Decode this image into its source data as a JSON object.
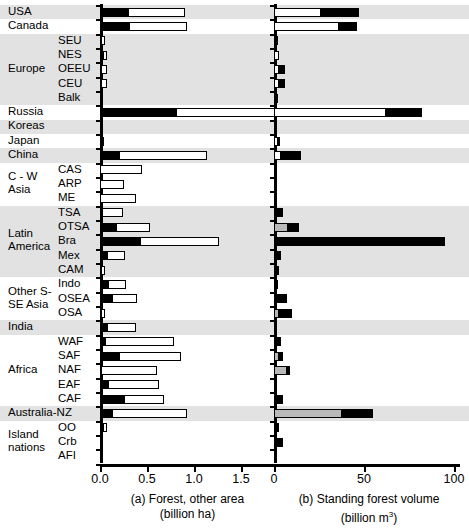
{
  "figure": {
    "panel_a": {
      "caption_line1": "(a) Forest, other area",
      "caption_line2": "(billion ha)"
    },
    "panel_b": {
      "caption_line1": "(b) Standing forest volume",
      "caption_line2": "(billion m",
      "caption_unit_sup": "3",
      "caption_close": ")"
    }
  },
  "chart_data": {
    "type": "bar",
    "orientation": "horizontal",
    "stacked": true,
    "grid": false,
    "legend_position": "none",
    "groups": [
      {
        "name": "USA",
        "band": "gray",
        "rows": [
          "USA"
        ]
      },
      {
        "name": "Canada",
        "band": "white",
        "rows": [
          "Canada"
        ]
      },
      {
        "name": "Europe",
        "band": "gray",
        "rows": [
          "SEU",
          "NES",
          "OEEU",
          "CEU",
          "Balk"
        ]
      },
      {
        "name": "Russia",
        "band": "white",
        "rows": [
          "Russia"
        ]
      },
      {
        "name": "Koreas",
        "band": "gray",
        "rows": [
          "Koreas"
        ]
      },
      {
        "name": "Japan",
        "band": "white",
        "rows": [
          "Japan"
        ]
      },
      {
        "name": "China",
        "band": "gray",
        "rows": [
          "China"
        ]
      },
      {
        "name": "C - W Asia",
        "band": "white",
        "rows": [
          "CAS",
          "ARP",
          "ME"
        ]
      },
      {
        "name": "Latin America",
        "band": "gray",
        "rows": [
          "TSA",
          "OTSA",
          "Bra",
          "Mex",
          "CAM"
        ]
      },
      {
        "name": "Other S- SE Asia",
        "band": "white",
        "rows": [
          "Indo",
          "OSEA",
          "OSA"
        ]
      },
      {
        "name": "India",
        "band": "gray",
        "rows": [
          "India"
        ]
      },
      {
        "name": "Africa",
        "band": "white",
        "rows": [
          "WAF",
          "SAF",
          "NAF",
          "EAF",
          "CAF"
        ]
      },
      {
        "name": "Australia-NZ",
        "band": "gray",
        "rows": [
          "Australia-NZ"
        ]
      },
      {
        "name": "Island nations",
        "band": "white",
        "rows": [
          "OO",
          "Crb",
          "AFI"
        ]
      }
    ],
    "panel_a": {
      "xlabel": "(a) Forest, other area (billion ha)",
      "xlim": [
        0,
        1.75
      ],
      "xticks": [
        0.0,
        0.5,
        1.0,
        1.5
      ],
      "xticklabels": [
        "0.0",
        "0.5",
        "1.0",
        "1.5"
      ],
      "series": [
        {
          "name": "forest",
          "color": "#000000"
        },
        {
          "name": "other",
          "color": "#ffffff"
        }
      ],
      "rows": [
        {
          "label": "USA",
          "forest": 0.3,
          "other": 0.6
        },
        {
          "label": "Canada",
          "forest": 0.31,
          "other": 0.62
        },
        {
          "label": "SEU",
          "forest": 0.01,
          "other": 0.04
        },
        {
          "label": "NES",
          "forest": 0.03,
          "other": 0.04
        },
        {
          "label": "OEEU",
          "forest": 0.01,
          "other": 0.06
        },
        {
          "label": "CEU",
          "forest": 0.01,
          "other": 0.06
        },
        {
          "label": "Balk",
          "forest": 0.01,
          "other": 0.02
        },
        {
          "label": "Russia",
          "forest": 0.81,
          "other": 1.64
        },
        {
          "label": "Koreas",
          "forest": 0.01,
          "other": 0.01
        },
        {
          "label": "Japan",
          "forest": 0.02,
          "other": 0.02
        },
        {
          "label": "China",
          "forest": 0.2,
          "other": 0.94
        },
        {
          "label": "CAS",
          "forest": 0.0,
          "other": 0.45
        },
        {
          "label": "ARP",
          "forest": 0.0,
          "other": 0.25
        },
        {
          "label": "ME",
          "forest": 0.0,
          "other": 0.38
        },
        {
          "label": "TSA",
          "forest": 0.02,
          "other": 0.23
        },
        {
          "label": "OTSA",
          "forest": 0.17,
          "other": 0.36
        },
        {
          "label": "Bra",
          "forest": 0.43,
          "other": 0.84
        },
        {
          "label": "Mex",
          "forest": 0.07,
          "other": 0.2
        },
        {
          "label": "CAM",
          "forest": 0.01,
          "other": 0.04
        },
        {
          "label": "Indo",
          "forest": 0.09,
          "other": 0.19
        },
        {
          "label": "OSEA",
          "forest": 0.13,
          "other": 0.26
        },
        {
          "label": "OSA",
          "forest": 0.01,
          "other": 0.04
        },
        {
          "label": "India",
          "forest": 0.07,
          "other": 0.31
        },
        {
          "label": "WAF",
          "forest": 0.05,
          "other": 0.74
        },
        {
          "label": "SAF",
          "forest": 0.2,
          "other": 0.66
        },
        {
          "label": "NAF",
          "forest": 0.01,
          "other": 0.6
        },
        {
          "label": "EAF",
          "forest": 0.09,
          "other": 0.54
        },
        {
          "label": "CAF",
          "forest": 0.26,
          "other": 0.42
        },
        {
          "label": "Australia-NZ",
          "forest": 0.13,
          "other": 0.8
        },
        {
          "label": "OO",
          "forest": 0.03,
          "other": 0.04
        },
        {
          "label": "Crb",
          "forest": 0.01,
          "other": 0.02
        },
        {
          "label": "AFI",
          "forest": 0.0,
          "other": 0.01
        }
      ]
    },
    "panel_b": {
      "xlabel": "(b) Standing forest volume (billion m3)",
      "xlim": [
        0,
        100
      ],
      "xticks": [
        0,
        50,
        100
      ],
      "xticklabels": [
        "0",
        "50",
        "100"
      ],
      "series": [
        {
          "name": "seg1",
          "color": "#ffffff"
        },
        {
          "name": "seg2",
          "color": "#b9b9b9"
        },
        {
          "name": "seg3",
          "color": "#000000"
        }
      ],
      "rows": [
        {
          "label": "USA",
          "seg1": 26,
          "seg2": 0,
          "seg3": 21
        },
        {
          "label": "Canada",
          "seg1": 36,
          "seg2": 0,
          "seg3": 10
        },
        {
          "label": "SEU",
          "seg1": 1,
          "seg2": 0,
          "seg3": 1
        },
        {
          "label": "NES",
          "seg1": 3,
          "seg2": 0,
          "seg3": 0
        },
        {
          "label": "OEEU",
          "seg1": 3,
          "seg2": 0,
          "seg3": 3
        },
        {
          "label": "CEU",
          "seg1": 3,
          "seg2": 0,
          "seg3": 3
        },
        {
          "label": "Balk",
          "seg1": 0,
          "seg2": 0,
          "seg3": 2
        },
        {
          "label": "Russia",
          "seg1": 62,
          "seg2": 0,
          "seg3": 20
        },
        {
          "label": "Koreas",
          "seg1": 0,
          "seg2": 0,
          "seg3": 1
        },
        {
          "label": "Japan",
          "seg1": 2,
          "seg2": 0,
          "seg3": 1
        },
        {
          "label": "China",
          "seg1": 4,
          "seg2": 0,
          "seg3": 11
        },
        {
          "label": "CAS",
          "seg1": 0,
          "seg2": 0,
          "seg3": 1
        },
        {
          "label": "ARP",
          "seg1": 0,
          "seg2": 0,
          "seg3": 0
        },
        {
          "label": "ME",
          "seg1": 0,
          "seg2": 0,
          "seg3": 1
        },
        {
          "label": "TSA",
          "seg1": 0,
          "seg2": 0,
          "seg3": 5
        },
        {
          "label": "OTSA",
          "seg1": 0,
          "seg2": 8,
          "seg3": 6
        },
        {
          "label": "Bra",
          "seg1": 0,
          "seg2": 0,
          "seg3": 95
        },
        {
          "label": "Mex",
          "seg1": 0,
          "seg2": 0,
          "seg3": 4
        },
        {
          "label": "CAM",
          "seg1": 0,
          "seg2": 0,
          "seg3": 3
        },
        {
          "label": "Indo",
          "seg1": 0,
          "seg2": 0,
          "seg3": 2
        },
        {
          "label": "OSEA",
          "seg1": 0,
          "seg2": 0,
          "seg3": 7
        },
        {
          "label": "OSA",
          "seg1": 0,
          "seg2": 3,
          "seg3": 7
        },
        {
          "label": "India",
          "seg1": 0,
          "seg2": 0,
          "seg3": 1
        },
        {
          "label": "WAF",
          "seg1": 0,
          "seg2": 0,
          "seg3": 4
        },
        {
          "label": "SAF",
          "seg1": 0,
          "seg2": 3,
          "seg3": 2
        },
        {
          "label": "NAF",
          "seg1": 0,
          "seg2": 7,
          "seg3": 2
        },
        {
          "label": "EAF",
          "seg1": 0,
          "seg2": 0,
          "seg3": 1
        },
        {
          "label": "CAF",
          "seg1": 0,
          "seg2": 0,
          "seg3": 5
        },
        {
          "label": "Australia-NZ",
          "seg1": 0,
          "seg2": 38,
          "seg3": 17
        },
        {
          "label": "OO",
          "seg1": 0,
          "seg2": 0,
          "seg3": 3
        },
        {
          "label": "Crb",
          "seg1": 0,
          "seg2": 0,
          "seg3": 5
        },
        {
          "label": "AFI",
          "seg1": 0,
          "seg2": 0,
          "seg3": 0
        }
      ]
    }
  },
  "labels": {
    "groups": [
      {
        "text": "USA",
        "lines": [
          "USA"
        ]
      },
      {
        "text": "Canada",
        "lines": [
          "Canada"
        ]
      },
      {
        "text": "Europe",
        "lines": [
          "Europe"
        ]
      },
      {
        "text": "Russia",
        "lines": [
          "Russia"
        ]
      },
      {
        "text": "Koreas",
        "lines": [
          "Koreas"
        ]
      },
      {
        "text": "Japan",
        "lines": [
          "Japan"
        ]
      },
      {
        "text": "China",
        "lines": [
          "China"
        ]
      },
      {
        "text": "C - W Asia",
        "lines": [
          "C - W",
          "Asia"
        ]
      },
      {
        "text": "Latin America",
        "lines": [
          "Latin",
          "America"
        ]
      },
      {
        "text": "Other S- SE Asia",
        "lines": [
          "Other S-",
          "SE Asia"
        ]
      },
      {
        "text": "India",
        "lines": [
          "India"
        ]
      },
      {
        "text": "Africa",
        "lines": [
          "Africa"
        ]
      },
      {
        "text": "Australia-NZ",
        "lines": [
          "Australia-NZ"
        ]
      },
      {
        "text": "Island nations",
        "lines": [
          "Island",
          "nations"
        ]
      }
    ],
    "subs": [
      "SEU",
      "NES",
      "OEEU",
      "CEU",
      "Balk",
      "CAS",
      "ARP",
      "ME",
      "TSA",
      "OTSA",
      "Bra",
      "Mex",
      "CAM",
      "Indo",
      "OSEA",
      "OSA",
      "WAF",
      "SAF",
      "NAF",
      "EAF",
      "CAF",
      "OO",
      "Crb",
      "AFI"
    ]
  }
}
